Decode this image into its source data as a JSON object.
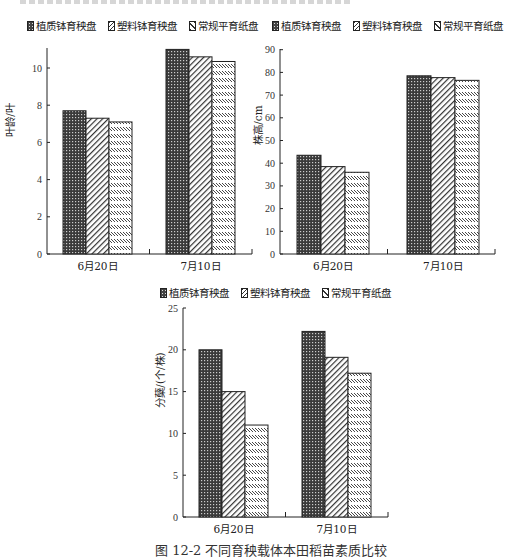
{
  "colors": {
    "dark_fill": "#444444",
    "line": "#222222",
    "background": "#ffffff"
  },
  "legend": [
    {
      "label": "植质钵育秧盘",
      "pattern": "p0"
    },
    {
      "label": "塑料钵育秧盘",
      "pattern": "p1"
    },
    {
      "label": "常规平育纸盘",
      "pattern": "p2"
    }
  ],
  "caption": "图 12-2   不同育秧载体本田稻苗素质比较",
  "chart_data": [
    {
      "type": "bar",
      "title": "",
      "xlabel": "",
      "ylabel": "叶龄/叶",
      "categories": [
        "6月20日",
        "7月10日"
      ],
      "series": [
        {
          "name": "植质钵育秧盘",
          "values": [
            7.7,
            11.0
          ]
        },
        {
          "name": "塑料钵育秧盘",
          "values": [
            7.3,
            10.6
          ]
        },
        {
          "name": "常规平育纸盘",
          "values": [
            7.1,
            10.35
          ]
        }
      ],
      "ylim": [
        0,
        11
      ],
      "yticks": [
        0,
        2,
        4,
        6,
        8,
        10
      ],
      "grid": false,
      "legend_position": "top"
    },
    {
      "type": "bar",
      "title": "",
      "xlabel": "",
      "ylabel": "株高/cm",
      "categories": [
        "6月20日",
        "7月10日"
      ],
      "series": [
        {
          "name": "植质钵育秧盘",
          "values": [
            43.5,
            78.5
          ]
        },
        {
          "name": "塑料钵育秧盘",
          "values": [
            38.5,
            77.7
          ]
        },
        {
          "name": "常规平育纸盘",
          "values": [
            36,
            76.5
          ]
        }
      ],
      "ylim": [
        0,
        90
      ],
      "yticks": [
        0,
        10,
        20,
        30,
        40,
        50,
        60,
        70,
        80,
        90
      ],
      "grid": false,
      "legend_position": "top"
    },
    {
      "type": "bar",
      "title": "",
      "xlabel": "",
      "ylabel": "分蘖/(个/株)",
      "categories": [
        "6月20日",
        "7月10日"
      ],
      "series": [
        {
          "name": "植质钵育秧盘",
          "values": [
            20,
            22.2
          ]
        },
        {
          "name": "塑料钵育秧盘",
          "values": [
            15,
            19.1
          ]
        },
        {
          "name": "常规平育纸盘",
          "values": [
            11,
            17.2
          ]
        }
      ],
      "ylim": [
        0,
        25
      ],
      "yticks": [
        0,
        5,
        10,
        15,
        20,
        25
      ],
      "grid": false,
      "legend_position": "top"
    }
  ]
}
